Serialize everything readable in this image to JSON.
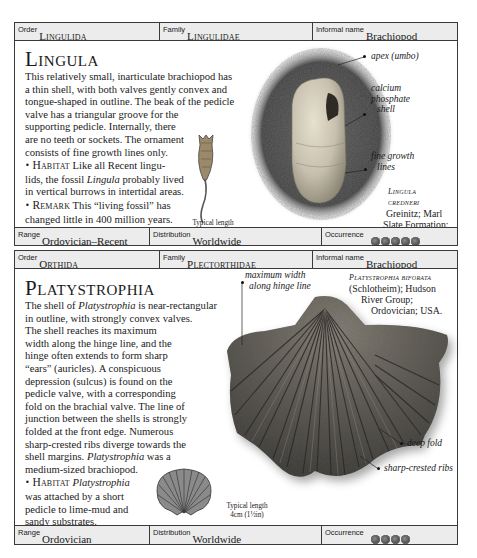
{
  "cards": [
    {
      "header": {
        "order_label": "Order",
        "order_value": "Lingulida",
        "family_label": "Family",
        "family_value": "Lingulidae",
        "informal_label": "Informal name",
        "informal_value": "Brachiopod"
      },
      "title": "Lingula",
      "description_lines": [
        "This relatively small, inarticulate brachiopod has",
        "a thin shell, with both valves gently convex and",
        "tongue-shaped in outline. The beak of the pedicle",
        "valve has a triangular groove for the",
        "supporting pedicle. Internally, there",
        "are no teeth or sockets. The ornament",
        "consists of fine growth lines only."
      ],
      "habitat": {
        "bullet": "•",
        "keyword": "Habitat",
        "line1": "Like all Recent lingu-",
        "line2_pre": "lids, the fossil ",
        "line2_italic": "Lingula",
        "line2_post": " probably lived",
        "line3": "in vertical burrows in intertidal areas."
      },
      "remark": {
        "bullet": "•",
        "keyword": "Remark",
        "line1": "This “living fossil” has",
        "line2": "changed little in 400 million years."
      },
      "annotations": {
        "apex": "apex (umbo)",
        "shell_1": "calcium",
        "shell_2": "phosphate",
        "shell_3": "shell",
        "growth_1": "fine growth",
        "growth_2": "lines"
      },
      "specimen": {
        "name_1": "Lingula",
        "name_2": "credneri",
        "line1": "Greinitz; Marl",
        "line2": "Slate Formation;",
        "line3": "Permian; UK."
      },
      "typical_length": {
        "label": "Typical length",
        "value": "1.5cm (⅝in)"
      },
      "footer": {
        "range_label": "Range",
        "range_value": "Ordovician–Recent",
        "distribution_label": "Distribution",
        "distribution_value": "Worldwide",
        "occurrence_label": "Occurrence",
        "occurrence_count": 5
      }
    },
    {
      "header": {
        "order_label": "Order",
        "order_value": "Orthida",
        "family_label": "Family",
        "family_value": "Plectorthidae",
        "informal_label": "Informal name",
        "informal_value": "Brachiopod"
      },
      "title": "Platystrophia",
      "description": {
        "l1_pre": "The shell of ",
        "l1_italic": "Platystrophia",
        "l1_post": " is near-rectangular",
        "lines": [
          "in outline, with strongly convex valves.",
          "The shell reaches its maximum",
          "width along the hinge line, and the",
          "hinge often extends to form sharp",
          "“ears” (auricles). A conspicuous",
          "depression (sulcus) is found on the",
          "pedicle valve, with a corresponding",
          "fold on the brachial valve. The line of",
          "junction between the shells is strongly",
          "folded at the front edge. Numerous",
          "sharp-crested ribs diverge towards the"
        ],
        "l13_pre": "shell margins. ",
        "l13_italic": "Platystrophia",
        "l13_post": " was a",
        "l14": "medium-sized brachiopod."
      },
      "habitat": {
        "bullet": "•",
        "keyword": "Habitat",
        "italic": "Platystrophia",
        "line2": "was attached by a short",
        "line3": "pedicle to lime-mud and",
        "line4": "sandy substrates."
      },
      "annotations": {
        "max_width_1": "maximum width",
        "max_width_2": "along hinge line",
        "deep_fold": "deep fold",
        "ribs": "sharp-crested ribs"
      },
      "specimen": {
        "name": "Platystrophia biforata",
        "line1": "(Schlotheim); Hudson",
        "line2": "River Group;",
        "line3": "Ordovician; USA."
      },
      "typical_length": {
        "label": "Typical length",
        "value": "4cm (1½in)"
      },
      "footer": {
        "range_label": "Range",
        "range_value": "Ordovician",
        "distribution_label": "Distribution",
        "distribution_value": "Worldwide",
        "occurrence_label": "Occurrence",
        "occurrence_count": 4
      }
    }
  ],
  "colors": {
    "bar_bg": "#ececec",
    "border": "#3a3a3a",
    "text": "#1a1a1a"
  }
}
